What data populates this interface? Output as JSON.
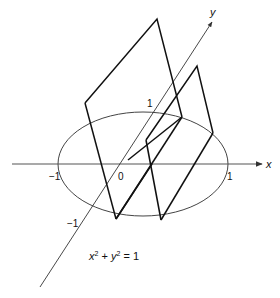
{
  "figure": {
    "axes": {
      "x_label": "x",
      "y_label": "y",
      "ticks": {
        "x_neg": "−1",
        "x_pos": "1",
        "origin": "0",
        "y_pos": "1",
        "y_neg": "−1"
      }
    },
    "equation": {
      "base_x": "x",
      "sup_x": "2",
      "plus": " + ",
      "base_y": "y",
      "sup_y": "2",
      "rest": " = 1"
    },
    "colors": {
      "line": "#111111",
      "axis": "#555555",
      "ellipse": "#444444"
    }
  }
}
